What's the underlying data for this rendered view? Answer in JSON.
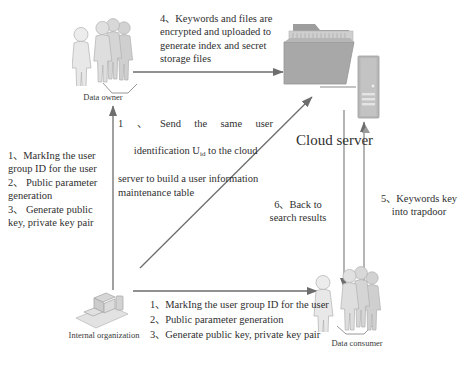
{
  "diagram": {
    "type": "flow-diagram",
    "palette": {
      "figure_light": "#e9e9e9",
      "figure_mid": "#c9c9c9",
      "figure_dark": "#a8a8a8",
      "folder_body": "#a6a6a6",
      "folder_back": "#bdbdbd",
      "tower": "#b5b5b5",
      "arrow": "#6a6a6a",
      "text": "#2f2f2f"
    }
  },
  "nodes": {
    "data_owner": {
      "label": "Data owner",
      "icon": "people-group-icon"
    },
    "cloud_folder": {
      "label": "",
      "icon": "folder-icon"
    },
    "cloud_tower": {
      "label": "",
      "icon": "server-tower-icon"
    },
    "cloud_server": {
      "label": "Cloud server"
    },
    "internal_organization": {
      "label": "Internal organization",
      "icon": "workstation-icon"
    },
    "data_consumer": {
      "label": "Data consumer",
      "icon": "people-group-icon"
    }
  },
  "steps": {
    "step4": {
      "lines": [
        "4、Keywords and files are",
        "encrypted and uploaded to",
        "generate index and secret",
        "storage files"
      ]
    },
    "step1_cloud": {
      "line1": [
        "1",
        "、",
        "Send",
        "the",
        "same",
        "user"
      ],
      "line2_a": "identification U",
      "line2_sub": "id",
      "line2_b": " to the cloud",
      "line3": "server to build a user information",
      "line4": "maintenance table"
    },
    "step_left": {
      "lines": [
        "1、MarkIng the user",
        "group ID for the user",
        "2、 Public parameter",
        "generation",
        "3、 Generate public",
        "key, private key pair"
      ]
    },
    "step_bottom": {
      "lines": [
        "1、MarkIng the user group ID for the user",
        "2、Public parameter generation",
        "3、Generate public key, private key pair"
      ]
    },
    "step5": {
      "lines": [
        "5、Keywords key",
        "into trapdoor"
      ]
    },
    "step6": {
      "lines": [
        "6、Back to",
        "search results"
      ]
    }
  }
}
